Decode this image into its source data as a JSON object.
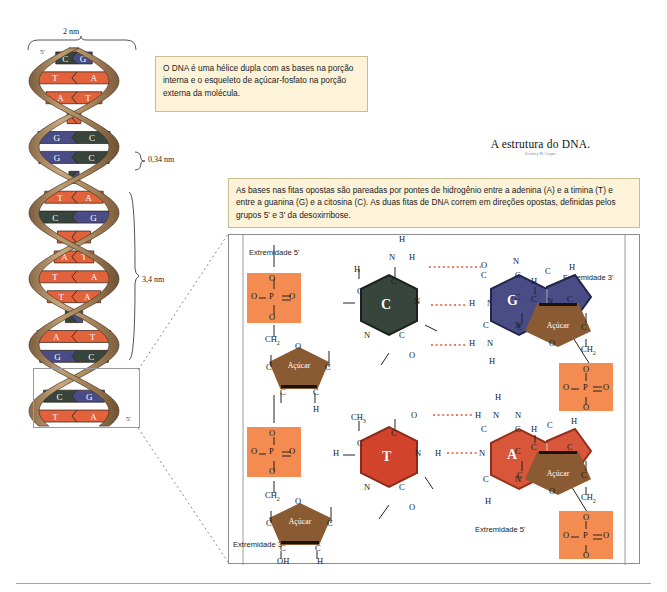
{
  "document": {
    "title": "A estrutura do DNA.",
    "credit": "Geoffrey M. Cooper"
  },
  "callouts": {
    "top": "O DNA é uma hélice dupla com as bases na porção interna e o esqueleto de açúcar-fosfato na porção externa da molécula.",
    "detail": "As bases nas fitas opostas são pareadas por pontes de hidrogênio entre a adenina (A) e a timina (T) e entre a guanina (G) e a citosina (C). As duas fitas de DNA correm em direções opostas, definidas pelos grupos 5' e 3' da desoxirribose."
  },
  "helix": {
    "measurements": {
      "width": "2 nm",
      "rise_per_base": "0,34 nm",
      "pitch": "3,4 nm"
    },
    "ends": {
      "top_left": "5'",
      "top_right": "3'",
      "bottom_left": "3'",
      "bottom_right": "5'"
    },
    "base_pairs": [
      {
        "left": "G",
        "right": "C"
      },
      {
        "left": "A",
        "right": "T"
      },
      {
        "left": "T",
        "right": "A"
      },
      {
        "left": "T",
        "right": "A"
      },
      {
        "left": "G",
        "right": "C"
      },
      {
        "left": "G",
        "right": "C"
      },
      {
        "left": "C",
        "right": "G"
      },
      {
        "left": "A",
        "right": "T"
      },
      {
        "left": "G",
        "right": "C"
      },
      {
        "left": "A",
        "right": "T"
      },
      {
        "left": "A",
        "right": "T"
      },
      {
        "left": "T",
        "right": "A"
      },
      {
        "left": "T",
        "right": "A"
      },
      {
        "left": "G",
        "right": "C"
      },
      {
        "left": "T",
        "right": "A"
      },
      {
        "left": "C",
        "right": "G"
      },
      {
        "left": "A",
        "right": "T"
      },
      {
        "left": "C",
        "right": "G"
      },
      {
        "left": "T",
        "right": "A"
      }
    ],
    "colors": {
      "backbone": "#b08d63",
      "base_a_t": "#e2623c",
      "base_g": "#4a4c86",
      "base_c": "#37453c"
    }
  },
  "detail": {
    "end_labels": {
      "top_left": "Extremidade 5'",
      "top_right": "Extremidade 3'",
      "bottom_left": "Extremidade 3'",
      "bottom_right": "Extremidade 5'"
    },
    "sugar_label": "Açúcar",
    "base_pairs": [
      {
        "left_base": "C",
        "right_base": "G",
        "hydrogen_bonds": 3,
        "left_color": "#37453c",
        "right_color": "#4a4c86"
      },
      {
        "left_base": "T",
        "right_base": "A",
        "hydrogen_bonds": 2,
        "left_color": "#d2432b",
        "right_color": "#d8573a"
      }
    ],
    "atoms": {
      "phosphorus": "P",
      "oxygen": "O",
      "nitrogen": "N",
      "carbon": "C",
      "hydrogen": "H",
      "methylene": "CH2",
      "methyl": "CH3",
      "hydroxyl": "OH"
    },
    "colors": {
      "phosphate_box": "#f48b50",
      "sugar": "#8a5a32",
      "hydrogen_bond": "#e0543a"
    }
  }
}
